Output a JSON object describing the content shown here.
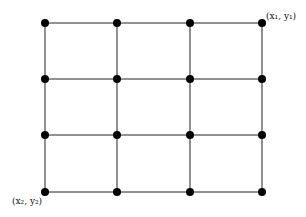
{
  "diagram": {
    "type": "grid-graph",
    "columns_x": [
      45,
      117,
      190,
      262
    ],
    "rows_y": [
      23,
      79,
      135,
      192
    ],
    "line_color": "#222222",
    "node_color": "#000000",
    "labels": {
      "top_right": "(x₁, y₁)",
      "bottom_left": "(x₂, y₂)"
    }
  }
}
